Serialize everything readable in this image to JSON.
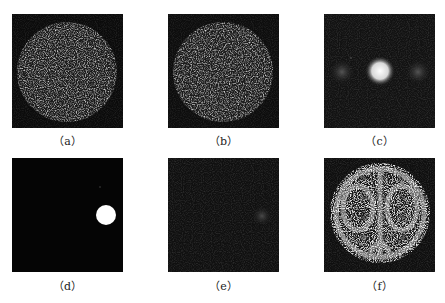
{
  "figure": {
    "panels": [
      {
        "id": "a",
        "caption": "（a）",
        "content": "speckle-disk"
      },
      {
        "id": "b",
        "caption": "（b）",
        "content": "speckle-disk"
      },
      {
        "id": "c",
        "caption": "（c）",
        "content": "three-spots-bright-center"
      },
      {
        "id": "d",
        "caption": "（d）",
        "content": "single-bright-spot-right"
      },
      {
        "id": "e",
        "caption": "（e）",
        "content": "faint-spot-right"
      },
      {
        "id": "f",
        "caption": "（f）",
        "content": "speckle-disk-with-fringe-pattern"
      }
    ]
  }
}
